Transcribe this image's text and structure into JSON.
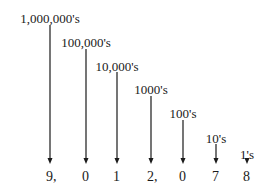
{
  "diagram": {
    "number": "9,012,078",
    "places": [
      {
        "label": "1,000,000's",
        "digit": "9,",
        "x": 50,
        "label_y": 12,
        "arrow_top": 25
      },
      {
        "label": "100,000's",
        "digit": "0",
        "x": 86,
        "label_y": 36,
        "arrow_top": 49
      },
      {
        "label": "10,000's",
        "digit": "1",
        "x": 117,
        "label_y": 60,
        "arrow_top": 72
      },
      {
        "label": "1000's",
        "digit": "2,",
        "x": 151,
        "label_y": 83,
        "arrow_top": 96
      },
      {
        "label": "100's",
        "digit": "0",
        "x": 183,
        "label_y": 107,
        "arrow_top": 120
      },
      {
        "label": "10's",
        "digit": "7",
        "x": 216,
        "label_y": 132,
        "arrow_top": 144
      },
      {
        "label": "1's",
        "digit": "8",
        "x": 247,
        "label_y": 148,
        "arrow_top": 158
      }
    ],
    "arrow_bottom": 164,
    "digit_y": 170,
    "colors": {
      "ink": "#1a1a1a",
      "background": "#ffffff"
    }
  }
}
